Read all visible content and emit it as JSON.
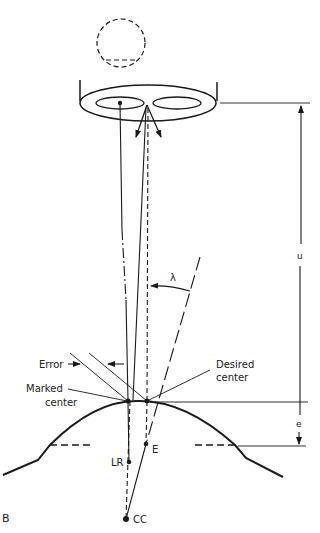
{
  "figure": {
    "panel_label": "B",
    "labels": {
      "error": "Error",
      "marked_center_line1": "Marked",
      "marked_center_line2": "center",
      "desired_center_line1": "Desired",
      "desired_center_line2": "center",
      "lambda": "λ",
      "u": "u",
      "e": "e",
      "point_E": "E",
      "point_LR": "LR",
      "point_CC": "CC"
    },
    "colors": {
      "stroke": "#1a1a1a",
      "background": "#ffffff"
    }
  }
}
